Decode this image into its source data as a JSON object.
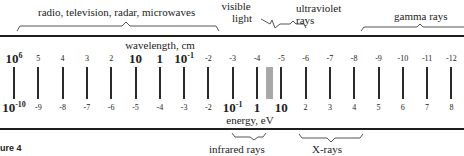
{
  "diagram": {
    "figure_label": "ure 4",
    "top_axis": {
      "label": "wavelength, cm",
      "ticks": [
        {
          "base": "10",
          "exp": "6",
          "big": true
        },
        {
          "text": "5"
        },
        {
          "text": "4"
        },
        {
          "text": "3"
        },
        {
          "text": "2"
        },
        {
          "text": "10",
          "big": true
        },
        {
          "text": "1",
          "big": true
        },
        {
          "base": "10",
          "exp": "-1",
          "big": true
        },
        {
          "text": "-2"
        },
        {
          "text": "-3"
        },
        {
          "text": "-4"
        },
        {
          "text": "-5"
        },
        {
          "text": "-6"
        },
        {
          "text": "-7"
        },
        {
          "text": "-8"
        },
        {
          "text": "-9"
        },
        {
          "text": "-10"
        },
        {
          "text": "-11"
        },
        {
          "text": "-12"
        }
      ]
    },
    "bottom_axis": {
      "label": "energy, eV",
      "ticks": [
        {
          "base": "10",
          "exp": "-10",
          "big": true
        },
        {
          "text": "-9"
        },
        {
          "text": "-8"
        },
        {
          "text": "-7"
        },
        {
          "text": "-6"
        },
        {
          "text": "-5"
        },
        {
          "text": "-4"
        },
        {
          "text": "-3"
        },
        {
          "text": "-2"
        },
        {
          "base": "10",
          "exp": "-1",
          "big": true
        },
        {
          "text": "1",
          "big": true
        },
        {
          "text": "10",
          "big": true
        },
        {
          "text": "2"
        },
        {
          "text": "3"
        },
        {
          "text": "4"
        },
        {
          "text": "5"
        },
        {
          "text": "6"
        },
        {
          "text": "7"
        },
        {
          "text": "8"
        }
      ]
    },
    "bands_top": [
      {
        "label": "radio, television, radar, microwaves"
      },
      {
        "label_line1": "visible",
        "label_line2": "light"
      },
      {
        "label_line1": "ultraviolet",
        "label_line2": "rays"
      },
      {
        "label": "gamma rays"
      }
    ],
    "bands_bottom": [
      {
        "label": "infrared rays"
      },
      {
        "label": "X-rays"
      }
    ],
    "visible_marker_color": "#a8a8a8",
    "line_color": "#1e1e1e"
  }
}
